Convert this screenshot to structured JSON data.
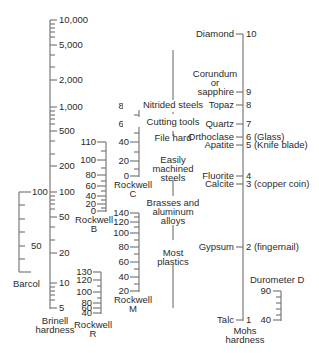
{
  "scales": {
    "brinell": {
      "name": "Brinell hardness",
      "name_line1": "Brinell",
      "name_line2": "hardness",
      "ticks": [
        "10,000",
        "5,000",
        "2,000",
        "1,000",
        "500",
        "200",
        "100",
        "50",
        "20",
        "10",
        "5"
      ]
    },
    "barcol": {
      "name": "Barcol",
      "ticks": [
        "100",
        "50"
      ]
    },
    "rockwell_b": {
      "name_line1": "Rockwell",
      "name_line2": "B",
      "ticks": [
        "110",
        "100",
        "80",
        "60",
        "40",
        "20",
        "0"
      ]
    },
    "rockwell_c": {
      "name_line1": "Rockwell",
      "name_line2": "C",
      "ticks": [
        "80",
        "60",
        "40",
        "20",
        "0"
      ]
    },
    "rockwell_m": {
      "name_line1": "Rockwell",
      "name_line2": "M",
      "ticks": [
        "140",
        "120",
        "100",
        "80",
        "60",
        "40",
        "20"
      ]
    },
    "rockwell_r": {
      "name_line1": "Rockwell",
      "name_line2": "R",
      "ticks": [
        "130",
        "120",
        "100",
        "80",
        "60",
        "40"
      ]
    },
    "materials": {
      "items": [
        "Nitrided steels",
        "Cutting tools",
        "File hard",
        "Easily",
        "machined",
        "steels",
        "Brasses and",
        "aluminum",
        "alloys",
        "Most",
        "plastics"
      ]
    },
    "mohs": {
      "name_line1": "Mohs",
      "name_line2": "hardness",
      "minerals": [
        {
          "mineral": "Diamond",
          "value": "10"
        },
        {
          "mineral": "Corundum",
          "mineral2": "or",
          "mineral3": "sapphire",
          "value": "9"
        },
        {
          "mineral": "Topaz",
          "value": "8"
        },
        {
          "mineral": "Quartz",
          "value": "7"
        },
        {
          "mineral": "Orthoclase",
          "value": "6 (Glass)"
        },
        {
          "mineral": "Apatite",
          "value": "5 (Knife blade)"
        },
        {
          "mineral": "Fluorite",
          "value": "4"
        },
        {
          "mineral": "Calcite",
          "value": "3 (copper coin)"
        },
        {
          "mineral": "Gypsum",
          "value": "2 (fingernail)"
        },
        {
          "mineral": "Talc",
          "value": "1"
        }
      ]
    },
    "durometer_d": {
      "name": "Durometer D",
      "ticks": [
        "90",
        "40"
      ]
    }
  },
  "colors": {
    "line": "#7a7a7a",
    "text": "#2b2b2b"
  }
}
